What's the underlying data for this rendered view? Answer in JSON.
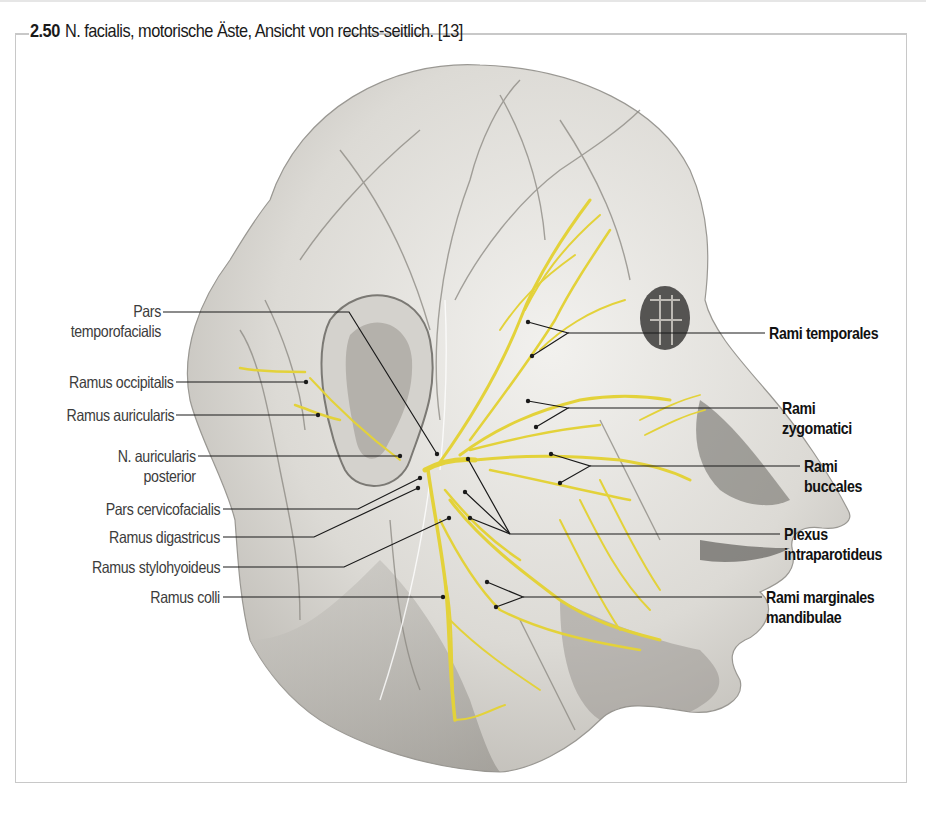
{
  "figure": {
    "number": "2.50",
    "caption": "N. facialis, motorische Äste, Ansicht von rechts-seitlich. [13]",
    "colors": {
      "nerve": "#e3d23a",
      "skin": "#d9d7d2",
      "vessel": "#8a8780",
      "leader": "#1a1a1a",
      "frame": "#c8c8c8"
    }
  },
  "labels_left": [
    {
      "line1": "Pars",
      "line2": "temporofacialis"
    },
    {
      "line1": "Ramus occipitalis"
    },
    {
      "line1": "Ramus auricularis"
    },
    {
      "line1": "N. auricularis",
      "line2": "posterior"
    },
    {
      "line1": "Pars cervicofacialis"
    },
    {
      "line1": "Ramus digastricus"
    },
    {
      "line1": "Ramus stylohyoideus"
    },
    {
      "line1": "Ramus colli"
    }
  ],
  "labels_right": [
    {
      "line1": "Rami temporales"
    },
    {
      "line1": "Rami",
      "line2": "zygomatici"
    },
    {
      "line1": "Rami",
      "line2": "buccales"
    },
    {
      "line1": "Plexus",
      "line2": "intraparotideus"
    },
    {
      "line1": "Rami marginales",
      "line2": "mandibulae"
    }
  ]
}
